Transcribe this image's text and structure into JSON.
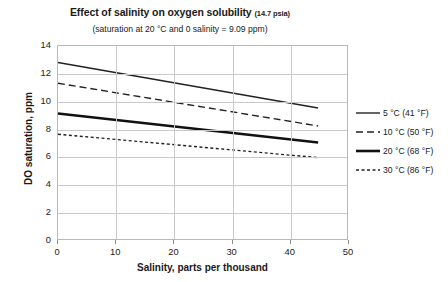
{
  "chart_data": {
    "type": "line",
    "title": "Effect of salinity on oxygen solubility",
    "title_suffix": "(14.7 psia)",
    "subtitle": "(saturation at 20 °C and 0 salinity = 9.09 ppm)",
    "xlabel": "Salinity, parts per thousand",
    "ylabel": "DO saturation, ppm",
    "xlim": [
      0,
      50
    ],
    "ylim": [
      0,
      14
    ],
    "xticks": [
      "0",
      "10",
      "20",
      "30",
      "40",
      "50"
    ],
    "yticks": [
      "0",
      "2",
      "4",
      "6",
      "8",
      "10",
      "12",
      "14"
    ],
    "xtick_values": [
      0,
      10,
      20,
      30,
      40,
      50
    ],
    "ytick_values": [
      0,
      2,
      4,
      6,
      8,
      10,
      12,
      14
    ],
    "grid": "both",
    "legend_position": "right",
    "x": [
      0,
      45
    ],
    "series": [
      {
        "name": "5 °C (41 °F)",
        "values": [
          12.8,
          9.5
        ],
        "style": "solid",
        "width": 1.4,
        "color": "#222222"
      },
      {
        "name": "10 °C (50 °F)",
        "values": [
          11.3,
          8.2
        ],
        "style": "dashed",
        "width": 1.4,
        "color": "#222222"
      },
      {
        "name": "20 °C (68 °F)",
        "values": [
          9.1,
          7.0
        ],
        "style": "solid",
        "width": 2.6,
        "color": "#111111"
      },
      {
        "name": "30 °C (86 °F)",
        "values": [
          7.6,
          5.9
        ],
        "style": "dotted",
        "width": 1.4,
        "color": "#222222"
      }
    ]
  },
  "colors": {
    "background": "#ffffff",
    "grid": "#c9c9c9",
    "frame": "#b9b9b9",
    "text": "#1a1a1a"
  }
}
